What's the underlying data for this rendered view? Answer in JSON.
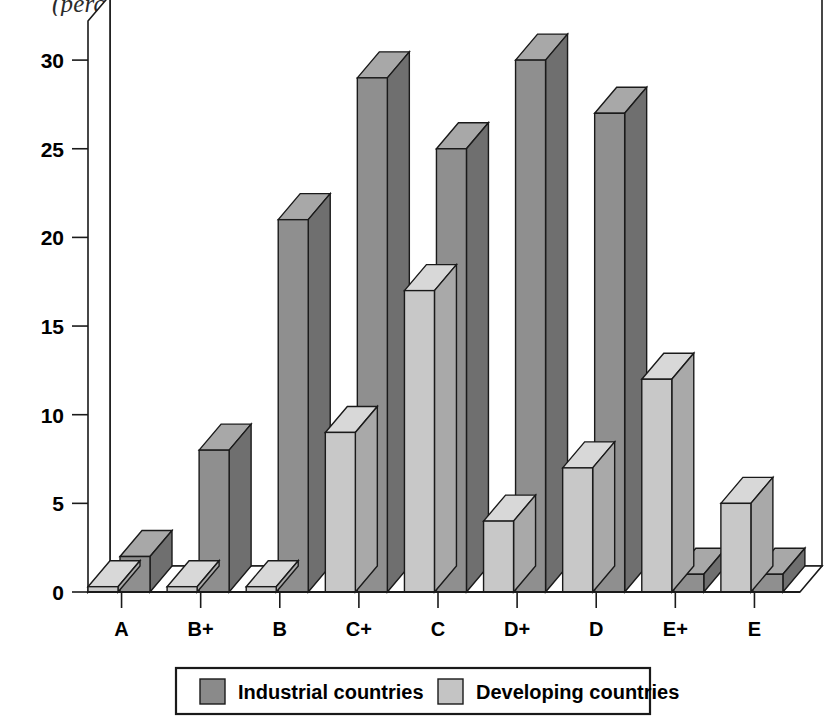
{
  "chart_data": {
    "type": "bar",
    "title": "(percentage of total rated banks)",
    "xlabel": "",
    "ylabel": "",
    "ylim": [
      0,
      32
    ],
    "yticks": [
      0,
      5,
      10,
      15,
      20,
      25,
      30
    ],
    "grid": false,
    "legend_position": "bottom",
    "categories": [
      "A",
      "B+",
      "B",
      "C+",
      "C",
      "D+",
      "D",
      "E+",
      "E"
    ],
    "series": [
      {
        "name": "Industrial countries",
        "color": "#8a8a8a",
        "values": [
          2,
          8,
          21,
          29,
          25,
          30,
          27,
          1,
          1
        ]
      },
      {
        "name": "Developing countries",
        "color": "#c4c4c4",
        "values": [
          0.3,
          0.3,
          0.3,
          9,
          17,
          4,
          7,
          12,
          5
        ]
      }
    ]
  },
  "legend": {
    "items": [
      {
        "label": "Industrial countries",
        "swatch": "#8a8a8a"
      },
      {
        "label": "Developing countries",
        "swatch": "#c4c4c4"
      }
    ]
  },
  "axis": {
    "y_tick_labels": [
      "30",
      "25",
      "20",
      "15",
      "10",
      "5",
      "0"
    ],
    "x_tick_labels": [
      "A",
      "B+",
      "B",
      "C+",
      "C",
      "D+",
      "D",
      "E+",
      "E"
    ]
  },
  "colors": {
    "industrial_front": "#8f8f8f",
    "industrial_side": "#6f6f6f",
    "industrial_top": "#a8a8a8",
    "developing_front": "#c8c8c8",
    "developing_side": "#a9a9a9",
    "developing_top": "#d8d8d8",
    "outline": "#1a1a1a",
    "frame": "#1a1a1a"
  }
}
